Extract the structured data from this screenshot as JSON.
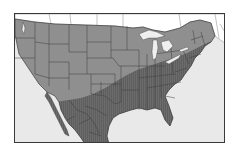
{
  "map": {
    "type": "range-map",
    "region": "Contiguous United States and Mexico",
    "colors": {
      "ocean": "#e9e9e9",
      "canada_land": "#ffffff",
      "outer_zone": "#8f8f8f",
      "inner_zone": "#6a6a6a",
      "borders": "#3c3c3c",
      "lakes": "#efefef",
      "frame": "#3a3a3a"
    },
    "zones": [
      {
        "name": "northern-western-range",
        "shade": "lighter gray",
        "extent": "Northern and western US"
      },
      {
        "name": "southern-eastern-range",
        "shade": "darker hatched gray",
        "extent": "Southeastern US, Gulf coast, California coast, Mexico"
      }
    ]
  }
}
